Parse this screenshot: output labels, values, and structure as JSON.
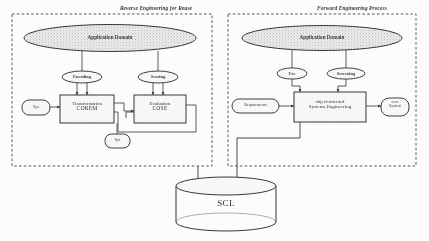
{
  "figure": {
    "type": "process-diagram",
    "background": "#ffffff",
    "ink_color": "#2b2b2b"
  },
  "panels": [
    {
      "id": "reverse",
      "title": "Reverse Engineering for Reuse",
      "border": "dashed"
    },
    {
      "id": "forward",
      "title": "Forward Engineering Process",
      "border": "dashed"
    }
  ],
  "domain_ellipses": [
    {
      "label": "Application Domain",
      "fill": "hatched-gray"
    },
    {
      "label": "Application Domain",
      "fill": "hatched-gray"
    }
  ],
  "reverse_panel": {
    "relation_ellipses": [
      {
        "label": "Encoding"
      },
      {
        "label": "Scoring"
      }
    ],
    "boxes": [
      {
        "label_line1": "Transformation",
        "label_line2": "COREM",
        "shape": "rect"
      },
      {
        "label_line1": "Evaluation",
        "label_line2": "COSE",
        "shape": "rect"
      }
    ],
    "input_node": {
      "label": "Sys",
      "shape": "rounded"
    },
    "lower_node": {
      "label": "Sys",
      "shape": "rounded"
    }
  },
  "forward_panel": {
    "relation_ellipses": [
      {
        "label": "Use"
      },
      {
        "label": "Screening"
      }
    ],
    "main_box": {
      "label_line1": "object-oriented",
      "label_line2": "Systems Engineering",
      "shape": "rect"
    },
    "left_node": {
      "label": "Requirements",
      "shape": "rounded"
    },
    "right_node": {
      "label_line1": "new",
      "label_line2": "System",
      "shape": "rounded"
    }
  },
  "repository": {
    "label": "SCL",
    "shape": "cylinder"
  }
}
